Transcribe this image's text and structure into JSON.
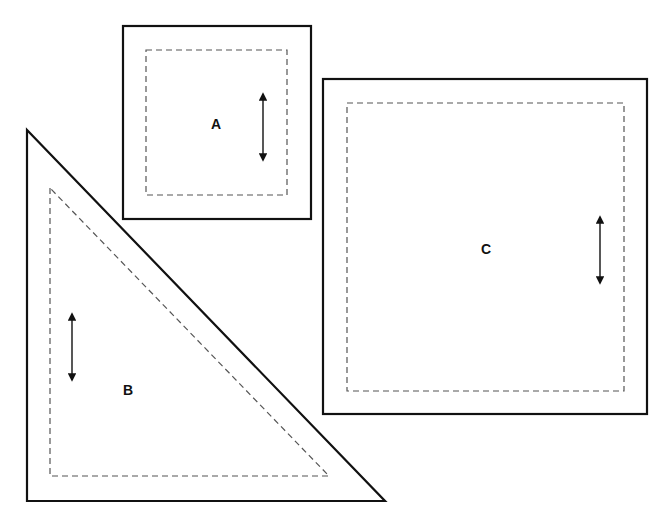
{
  "pieces": [
    {
      "label": "A",
      "shape": "square",
      "outer": [
        123,
        26,
        311,
        219
      ],
      "seam": [
        146,
        50,
        287,
        195
      ],
      "grain_arrow": {
        "x": 263,
        "y1": 92,
        "y2": 162
      },
      "label_pos": [
        216,
        129
      ]
    },
    {
      "label": "B",
      "shape": "right-triangle",
      "outer": [
        [
          27,
          130
        ],
        [
          27,
          501
        ],
        [
          385,
          501
        ]
      ],
      "seam": [
        [
          50,
          188
        ],
        [
          50,
          476
        ],
        [
          329,
          476
        ]
      ],
      "grain_arrow": {
        "x": 72,
        "y1": 312,
        "y2": 382
      },
      "label_pos": [
        128,
        395
      ]
    },
    {
      "label": "C",
      "shape": "square",
      "outer": [
        323,
        79,
        647,
        414
      ],
      "seam": [
        347,
        103,
        624,
        391
      ],
      "grain_arrow": {
        "x": 600,
        "y1": 215,
        "y2": 285
      },
      "label_pos": [
        486,
        254
      ]
    }
  ],
  "colors": {
    "outline": "#111111",
    "seam": "#555555",
    "background": "#ffffff"
  }
}
